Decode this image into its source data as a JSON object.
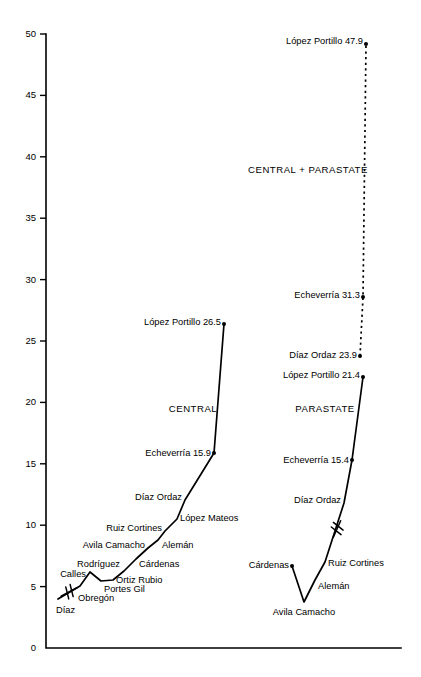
{
  "chart_data": {
    "type": "line",
    "title": "",
    "subtitle": "",
    "xlabel": "",
    "ylabel": "",
    "ylim": [
      0,
      50
    ],
    "y_ticks": [
      0,
      5,
      10,
      15,
      20,
      25,
      30,
      35,
      40,
      45,
      50
    ],
    "y_tick_labels": [
      "0",
      "5",
      "10",
      "15",
      "20",
      "25",
      "30",
      "35",
      "40",
      "45",
      "50"
    ],
    "grid": false,
    "legend_position": "inline-annotations",
    "x_axis_visible": true,
    "x_tick_labels": [],
    "axis_note": "Horizontal axis is unlabeled; points are successive Mexican presidential administrations.",
    "series": [
      {
        "name": "CENTRAL",
        "style": "solid",
        "label_x": 193,
        "label_y": 409,
        "has_axis_break": true,
        "points": [
          {
            "label": "Díaz",
            "value": null,
            "value_text": "",
            "px": 58,
            "py": 599,
            "label_x": 56,
            "label_y": 611,
            "anchor": "start",
            "dot": false
          },
          {
            "label": "Obregón",
            "value": null,
            "value_text": "",
            "px": 80,
            "py": 586,
            "label_x": 78,
            "label_y": 599,
            "anchor": "start",
            "dot": false
          },
          {
            "label": "Calles",
            "value": null,
            "value_text": "",
            "px": 90,
            "py": 572,
            "label_x": 86,
            "label_y": 575,
            "anchor": "end",
            "dot": false
          },
          {
            "label": "Portes Gil",
            "value": null,
            "value_text": "",
            "px": 101,
            "py": 581,
            "label_x": 104,
            "label_y": 590,
            "anchor": "start",
            "dot": false
          },
          {
            "label": "Ortiz Rubio",
            "value": null,
            "value_text": "",
            "px": 113,
            "py": 580,
            "label_x": 116,
            "label_y": 581,
            "anchor": "start",
            "dot": false
          },
          {
            "label": "Rodríguez",
            "value": null,
            "value_text": "",
            "px": 124,
            "py": 571,
            "label_x": 120,
            "label_y": 565,
            "anchor": "end",
            "dot": false
          },
          {
            "label": "Cárdenas",
            "value": null,
            "value_text": "",
            "px": 136,
            "py": 559,
            "label_x": 139,
            "label_y": 565,
            "anchor": "start",
            "dot": false
          },
          {
            "label": "Avila Camacho",
            "value": null,
            "value_text": "",
            "px": 148,
            "py": 548,
            "label_x": 145,
            "label_y": 546,
            "anchor": "end",
            "dot": false
          },
          {
            "label": "Alemán",
            "value": null,
            "value_text": "",
            "px": 158,
            "py": 540,
            "label_x": 162,
            "label_y": 546,
            "anchor": "start",
            "dot": false
          },
          {
            "label": "Ruiz Cortines",
            "value": null,
            "value_text": "",
            "px": 165,
            "py": 531,
            "label_x": 162,
            "label_y": 529,
            "anchor": "end",
            "dot": false
          },
          {
            "label": "López Mateos",
            "value": null,
            "value_text": "",
            "px": 177,
            "py": 519,
            "label_x": 180,
            "label_y": 519,
            "anchor": "start",
            "dot": false
          },
          {
            "label": "Díaz Ordaz",
            "value": null,
            "value_text": "",
            "px": 185,
            "py": 500,
            "label_x": 182,
            "label_y": 498,
            "anchor": "end",
            "dot": false
          },
          {
            "label": "Echeverría",
            "value": 15.9,
            "value_text": "15.9",
            "px": 214,
            "py": 453,
            "label_x": 211,
            "label_y": 454,
            "anchor": "end",
            "dot": true
          },
          {
            "label": "López Portillo",
            "value": 26.5,
            "value_text": "26.5",
            "px": 224,
            "py": 324,
            "label_x": 221,
            "label_y": 323,
            "anchor": "end",
            "dot": true
          }
        ]
      },
      {
        "name": "PARASTATE",
        "style": "solid",
        "label_x": 325,
        "label_y": 409,
        "has_axis_break": true,
        "points": [
          {
            "label": "Cárdenas",
            "value": null,
            "value_text": "",
            "px": 292,
            "py": 566,
            "label_x": 289,
            "label_y": 566,
            "anchor": "end",
            "dot": true
          },
          {
            "label": "Avila Camacho",
            "value": null,
            "value_text": "",
            "px": 304,
            "py": 602,
            "label_x": 304,
            "label_y": 613,
            "anchor": "mid",
            "dot": false
          },
          {
            "label": "Alemán",
            "value": null,
            "value_text": "",
            "px": 315,
            "py": 580,
            "label_x": 318,
            "label_y": 587,
            "anchor": "start",
            "dot": false
          },
          {
            "label": "Ruiz Cortines",
            "value": null,
            "value_text": "",
            "px": 325,
            "py": 562,
            "label_x": 328,
            "label_y": 564,
            "anchor": "start",
            "dot": false
          },
          {
            "label": "Díaz Ordaz",
            "value": null,
            "value_text": "",
            "px": 344,
            "py": 503,
            "label_x": 341,
            "label_y": 501,
            "anchor": "end",
            "dot": false
          },
          {
            "label": "Echeverría",
            "value": 15.4,
            "value_text": "15.4",
            "px": 352,
            "py": 460,
            "label_x": 349,
            "label_y": 461,
            "anchor": "end",
            "dot": true
          },
          {
            "label": "López Portillo",
            "value": 21.4,
            "value_text": "21.4",
            "px": 363,
            "py": 377,
            "label_x": 360,
            "label_y": 376,
            "anchor": "end",
            "dot": true
          }
        ]
      },
      {
        "name": "CENTRAL + PARASTATE",
        "style": "dashed",
        "label_x": 308,
        "label_y": 170,
        "has_axis_break": false,
        "points": [
          {
            "label": "Díaz Ordaz",
            "value": 23.9,
            "value_text": "23.9",
            "px": 360,
            "py": 356,
            "label_x": 357,
            "label_y": 356,
            "anchor": "end",
            "dot": true
          },
          {
            "label": "Echeverría",
            "value": 31.3,
            "value_text": "31.3",
            "px": 363,
            "py": 297,
            "label_x": 360,
            "label_y": 296,
            "anchor": "end",
            "dot": true
          },
          {
            "label": "López Portillo",
            "value": 47.9,
            "value_text": "47.9",
            "px": 366,
            "py": 44,
            "label_x": 363,
            "label_y": 42,
            "anchor": "end",
            "dot": true
          }
        ]
      }
    ]
  },
  "axes": {
    "y_axis_label": "",
    "x_axis_label": ""
  }
}
